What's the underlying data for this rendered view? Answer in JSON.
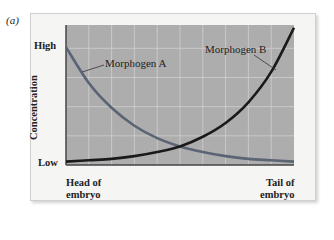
{
  "panel_label": "(a)",
  "chart_data": {
    "type": "line",
    "title": "",
    "xlabel": "",
    "ylabel": "Concentration",
    "x_tick_labels": {
      "left": [
        "Head of",
        "embryo"
      ],
      "right": [
        "Tail of",
        "embryo"
      ]
    },
    "y_tick_labels": {
      "top": "High",
      "bottom": "Low"
    },
    "x_range": [
      0,
      1
    ],
    "ylim": [
      0,
      1
    ],
    "grid": true,
    "legend_position": "inline annotations",
    "x": [
      0,
      0.1,
      0.2,
      0.3,
      0.4,
      0.5,
      0.6,
      0.7,
      0.8,
      0.9,
      1.0
    ],
    "series": [
      {
        "name": "Morphogen A",
        "color": "#5a6474",
        "values": [
          0.84,
          0.58,
          0.4,
          0.27,
          0.18,
          0.12,
          0.08,
          0.05,
          0.03,
          0.02,
          0.01
        ]
      },
      {
        "name": "Morphogen B",
        "color": "#1a1a1a",
        "values": [
          0.01,
          0.02,
          0.03,
          0.05,
          0.08,
          0.12,
          0.19,
          0.29,
          0.44,
          0.66,
          0.98
        ]
      }
    ],
    "annotations": [
      {
        "text": "Morphogen A",
        "points_to": "Morphogen A curve near head"
      },
      {
        "text": "Morphogen B",
        "points_to": "Morphogen B curve near tail"
      }
    ]
  },
  "colors": {
    "plot_background": "#adadad",
    "grid": "#cfcfcf",
    "frame_background": "#f5f5f3"
  }
}
